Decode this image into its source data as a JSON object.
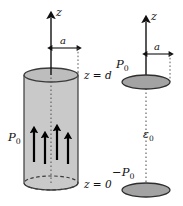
{
  "figure": {
    "background_color": "#ffffff",
    "width": 183,
    "height": 206
  },
  "colors": {
    "cylinder_body": "#c9c9c9",
    "cylinder_top_disk": "#bdbdbd",
    "cylinder_outline": "#3a3a3a",
    "charge_disk": "#a3a3a3",
    "charge_disk_outline": "#2e2e2e",
    "axis": "#111111",
    "arrow": "#000000",
    "dotted": "#5a5a5a",
    "text": "#111111"
  },
  "left_panel": {
    "name": "polarized-cylinder",
    "axis_label": "z",
    "radius_label": "a",
    "polarization_label": "P",
    "polarization_sub": "0",
    "top_plane_label": "z = d",
    "bottom_plane_label": "z = 0",
    "polarization_arrow_count": 4,
    "arrows": [
      {
        "x": 34,
        "tip_y": 128,
        "tail_y": 162
      },
      {
        "x": 45,
        "tip_y": 133,
        "tail_y": 164
      },
      {
        "x": 57,
        "tip_y": 126,
        "tail_y": 160
      },
      {
        "x": 68,
        "tip_y": 134,
        "tail_y": 164
      }
    ],
    "cylinder": {
      "center_x": 51,
      "top_y": 75,
      "bottom_y": 183,
      "radius_x": 27,
      "radius_y": 7
    }
  },
  "right_panel": {
    "name": "equivalent-charge-disks",
    "axis_label": "z",
    "radius_label": "a",
    "top_charge_label": "P",
    "top_charge_sub": "0",
    "bottom_charge_label": "−P",
    "bottom_charge_sub": "0",
    "permittivity_label": "ε",
    "permittivity_sub": "0",
    "disks": [
      {
        "center_x": 146,
        "center_y": 82,
        "radius_x": 24,
        "radius_y": 7,
        "name": "top-disk"
      },
      {
        "center_x": 146,
        "center_y": 190,
        "radius_x": 24,
        "radius_y": 7,
        "name": "bottom-disk"
      }
    ]
  }
}
